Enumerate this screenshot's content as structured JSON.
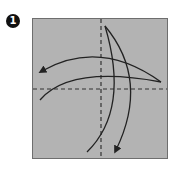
{
  "step": {
    "number": "1"
  },
  "paper": {
    "fill": "#b3b3b3",
    "border": "#6e6e6e"
  },
  "folds": [
    {
      "type": "valley-fold",
      "orientation": "vertical",
      "label": "vertical-crease"
    },
    {
      "type": "valley-fold",
      "orientation": "horizontal",
      "label": "horizontal-crease"
    }
  ],
  "arrows": [
    {
      "label": "fold-right-to-left",
      "direction": "left"
    },
    {
      "label": "fold-top-to-bottom",
      "direction": "down"
    }
  ],
  "colors": {
    "line": "#222222",
    "badge": "#111111"
  }
}
